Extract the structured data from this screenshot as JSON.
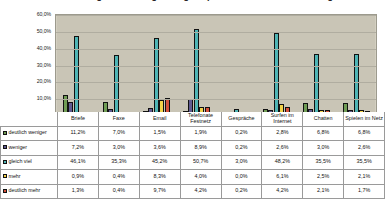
{
  "chart_data": {
    "type": "bar",
    "title": "Veränderung der Nutzungshäufigkeit privater Kommunikationswege",
    "xlabel": "",
    "ylabel": "",
    "ylim": [
      0,
      60
    ],
    "ytick_labels": [
      "60,0%",
      "50,0%",
      "40,0%",
      "30,0%",
      "20,0%",
      "10,0%",
      "0,0%"
    ],
    "ytick_values": [
      60,
      50,
      40,
      30,
      20,
      10,
      0
    ],
    "grid": true,
    "legend_position": "table-rowheaders",
    "categories": [
      "Briefe",
      "Faxe",
      "Email",
      "Telefonate Festnetz",
      "Gespräche",
      "Surfen im Internet",
      "Chatten",
      "Spielen im Netz"
    ],
    "series": [
      {
        "name": "deutlich weniger",
        "color": "#6f9c54",
        "values": [
          11.2,
          7.0,
          1.5,
          1.9,
          0.2,
          2.8,
          6.8,
          6.8
        ],
        "labels": [
          "11,2%",
          "7,0%",
          "1,5%",
          "1,9%",
          "0,2%",
          "2,8%",
          "6,8%",
          "6,8%"
        ]
      },
      {
        "name": "weniger",
        "color": "#605b91",
        "values": [
          7.2,
          3.0,
          3.6,
          8.9,
          0.2,
          2.6,
          3.0,
          2.6
        ],
        "labels": [
          "7,2%",
          "3,0%",
          "3,6%",
          "8,9%",
          "0,2%",
          "2,6%",
          "3,0%",
          "2,6%"
        ]
      },
      {
        "name": "gleich viel",
        "color": "#4fb4b4",
        "values": [
          46.1,
          35.3,
          45.2,
          50.7,
          3.0,
          48.2,
          35.5,
          35.5
        ],
        "labels": [
          "46,1%",
          "35,3%",
          "45,2%",
          "50,7%",
          "3,0%",
          "48,2%",
          "35,5%",
          "35,5%"
        ]
      },
      {
        "name": "mehr",
        "color": "#f2d249",
        "values": [
          0.9,
          0.4,
          8.3,
          4.0,
          0.0,
          6.1,
          2.5,
          2.1
        ],
        "labels": [
          "0,9%",
          "0,4%",
          "8,3%",
          "4,0%",
          "0,0%",
          "6,1%",
          "2,5%",
          "2,1%"
        ]
      },
      {
        "name": "deutlich mehr",
        "color": "#d4503a",
        "values": [
          1.3,
          0.4,
          9.7,
          4.2,
          0.2,
          4.2,
          2.1,
          1.7
        ],
        "labels": [
          "1,3%",
          "0,4%",
          "9,7%",
          "4,2%",
          "0,2%",
          "4,2%",
          "2,1%",
          "1,7%"
        ]
      }
    ]
  },
  "colors": {
    "plot_background": "#c9c5b6",
    "gridline": "#b0ada0",
    "plot_border": "#9c9a8d",
    "bar_outline": "#111111",
    "table_border": "#9a9a9a"
  }
}
